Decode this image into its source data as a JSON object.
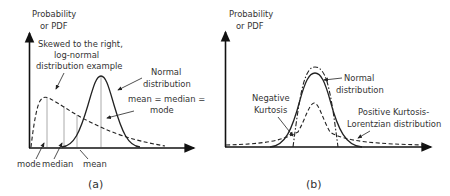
{
  "figure": {
    "panels": [
      {
        "id": "a",
        "caption": "(a)",
        "y_axis_label_line1": "Probability",
        "y_axis_label_line2": "or PDF",
        "annotations": {
          "skewed_line1": "Skewed to the right,",
          "skewed_line2": "log-normal",
          "skewed_line3": "distribution example",
          "normal_line1": "Normal",
          "normal_line2": "distribution",
          "equality_line1": "mean = median =",
          "equality_line2": "mode",
          "mode": "mode",
          "median": "median",
          "mean": "mean"
        },
        "curves": [
          {
            "name": "Log-normal (skewed right)",
            "style": "dashed"
          },
          {
            "name": "Normal distribution",
            "style": "solid"
          }
        ]
      },
      {
        "id": "b",
        "caption": "(b)",
        "y_axis_label_line1": "Probability",
        "y_axis_label_line2": "or PDF",
        "annotations": {
          "normal_line1": "Normal",
          "normal_line2": "distribution",
          "negative_line1": "Negative",
          "negative_line2": "Kurtosis",
          "positive_line1": "Positive Kurtosis-",
          "positive_line2": "Lorentzian distribution"
        },
        "curves": [
          {
            "name": "Normal distribution",
            "style": "solid"
          },
          {
            "name": "Negative Kurtosis",
            "style": "dash-dot"
          },
          {
            "name": "Positive Kurtosis - Lorentzian",
            "style": "dashed"
          }
        ]
      }
    ],
    "colors": {
      "axis": "#111111",
      "curve": "#222222",
      "guide_line": "#aaaaaa",
      "text": "#333333"
    }
  }
}
